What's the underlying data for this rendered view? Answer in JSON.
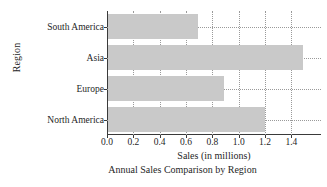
{
  "chart_data": {
    "type": "bar",
    "orientation": "horizontal",
    "title": "",
    "caption": "Annual Sales Comparison by Region",
    "xlabel": "Sales (in millions)",
    "ylabel": "Region",
    "categories": [
      "North America",
      "Europe",
      "Asia",
      "South America"
    ],
    "values": [
      1.2,
      0.89,
      1.49,
      0.69
    ],
    "series": [
      {
        "name": "Sales",
        "values": [
          1.2,
          0.89,
          1.49,
          0.69
        ]
      }
    ],
    "xlim": [
      0.0,
      1.625
    ],
    "xticks": [
      0.0,
      0.2,
      0.4,
      0.6,
      0.8,
      1.0,
      1.2,
      1.4
    ],
    "xtick_labels": [
      "0.0",
      "0.2",
      "0.4",
      "0.6",
      "0.8",
      "1.0",
      "1.2",
      "1.4"
    ],
    "grid": true,
    "grid_style": "dotted",
    "legend": false,
    "bar_color": "#c9c9c9",
    "axis_color": "#3a3a3a",
    "grid_color": "#9a9a9a",
    "background": "#ffffff"
  }
}
